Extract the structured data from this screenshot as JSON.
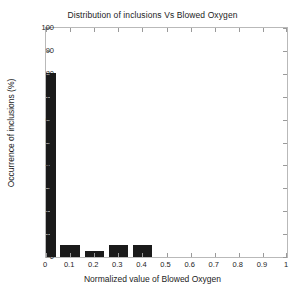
{
  "chart_data": {
    "type": "bar",
    "title": "Distribution of inclusions Vs Blowed Oxygen",
    "xlabel": "Normalized value of Blowed Oxygen",
    "ylabel": "Occurrence of inclusions (%)",
    "xlim": [
      0,
      1
    ],
    "ylim": [
      0,
      100
    ],
    "grid": false,
    "legend": null,
    "xticks": [
      "0",
      "0.1",
      "0.2",
      "0.3",
      "0.4",
      "0.5",
      "0.6",
      "0.7",
      "0.8",
      "0.9",
      "1"
    ],
    "xtick_values": [
      0,
      0.1,
      0.2,
      0.3,
      0.4,
      0.5,
      0.6,
      0.7,
      0.8,
      0.9,
      1
    ],
    "yticks": [
      "0",
      "10",
      "20",
      "30",
      "40",
      "50",
      "60",
      "70",
      "80",
      "90",
      "100"
    ],
    "ytick_values": [
      0,
      10,
      20,
      30,
      40,
      50,
      60,
      70,
      80,
      90,
      100
    ],
    "bar_color": "#1a1a1a",
    "frame_color": "#b9b9b9",
    "categories": [
      0,
      0.1,
      0.2,
      0.3,
      0.4
    ],
    "values": [
      80.5,
      5.3,
      2.5,
      5.3,
      5.3
    ],
    "bins": [
      {
        "label": "0",
        "center": 0.02,
        "x0": 0.0,
        "x1": 0.04,
        "value": 80.5
      },
      {
        "label": "0.1",
        "center": 0.1,
        "x0": 0.06,
        "x1": 0.14,
        "value": 5.3
      },
      {
        "label": "0.2",
        "center": 0.2,
        "x0": 0.16,
        "x1": 0.24,
        "value": 2.5
      },
      {
        "label": "0.3",
        "center": 0.3,
        "x0": 0.26,
        "x1": 0.34,
        "value": 5.3
      },
      {
        "label": "0.4",
        "center": 0.4,
        "x0": 0.36,
        "x1": 0.44,
        "value": 5.3
      }
    ]
  }
}
